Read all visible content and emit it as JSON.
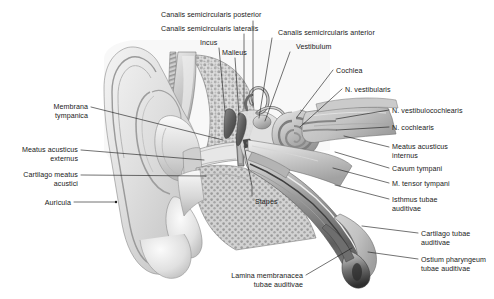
{
  "figure": {
    "background_color": "#ffffff",
    "text_color": "#1a1a1a",
    "leader_color": "#1a1a1a",
    "width": 494,
    "height": 299
  },
  "labels": [
    {
      "id": "canalis-semicircularis-posterior",
      "text": "Canalis semicircularis posterior",
      "lines": [
        "Canalis semicircularis posterior"
      ],
      "align": "left",
      "x": 161,
      "y": 11
    },
    {
      "id": "canalis-semicircularis-lateralis",
      "text": "Canalis semicircularis lateralis",
      "lines": [
        "Canalis semicircularis lateralis"
      ],
      "align": "left",
      "x": 161,
      "y": 25
    },
    {
      "id": "incus",
      "text": "Incus",
      "lines": [
        "Incus"
      ],
      "align": "left",
      "x": 200,
      "y": 39
    },
    {
      "id": "malleus",
      "text": "Malleus",
      "lines": [
        "Malleus"
      ],
      "align": "left",
      "x": 222,
      "y": 49
    },
    {
      "id": "canalis-semicircularis-anterior",
      "text": "Canalis semicircularis anterior",
      "lines": [
        "Canalis semicircularis anterior"
      ],
      "align": "left",
      "x": 278,
      "y": 29
    },
    {
      "id": "vestibulum",
      "text": "Vestibulum",
      "lines": [
        "Vestibulum"
      ],
      "align": "left",
      "x": 296,
      "y": 43
    },
    {
      "id": "cochlea",
      "text": "Cochlea",
      "lines": [
        "Cochlea"
      ],
      "align": "left",
      "x": 336,
      "y": 67
    },
    {
      "id": "n-vestibularis",
      "text": "N. vestibularis",
      "lines": [
        "N. vestibularis"
      ],
      "align": "left",
      "x": 345,
      "y": 86
    },
    {
      "id": "n-vestibulocochlearis",
      "text": "N. vestibulocochlearis",
      "lines": [
        "N. vestibulocochlearis"
      ],
      "align": "left",
      "x": 392,
      "y": 107
    },
    {
      "id": "n-cochlearis",
      "text": "N. cochlearis",
      "lines": [
        "N. cochlearis"
      ],
      "align": "left",
      "x": 392,
      "y": 124
    },
    {
      "id": "meatus-acusticus-internus",
      "text": "Meatus acusticus internus",
      "lines": [
        "Meatus acusticus",
        "internus"
      ],
      "align": "left",
      "x": 392,
      "y": 143
    },
    {
      "id": "cavum-tympani",
      "text": "Cavum tympani",
      "lines": [
        "Cavum tympani"
      ],
      "align": "left",
      "x": 392,
      "y": 165
    },
    {
      "id": "m-tensor-tympani",
      "text": "M. tensor tympani",
      "lines": [
        "M. tensor tympani"
      ],
      "align": "left",
      "x": 392,
      "y": 180
    },
    {
      "id": "isthmus-tubae-auditivae",
      "text": "Isthmus tubae auditivae",
      "lines": [
        "Isthmus tubae",
        "auditivae"
      ],
      "align": "left",
      "x": 392,
      "y": 196
    },
    {
      "id": "cartilago-tubae-auditivae",
      "text": "Cartilago tubae auditivae",
      "lines": [
        "Cartilago tubae",
        "auditivae"
      ],
      "align": "left",
      "x": 421,
      "y": 230
    },
    {
      "id": "ostium-pharyngeum-tubae-auditivae",
      "text": "Ostium pharyngeum tubae auditivae",
      "lines": [
        "Ostium pharyngeum",
        "tubae auditivae"
      ],
      "align": "left",
      "x": 421,
      "y": 256
    },
    {
      "id": "membrana-tympanica",
      "text": "Membrana tympanica",
      "lines": [
        "Membrana",
        "tympanica"
      ],
      "align": "right",
      "x": 88,
      "y": 103
    },
    {
      "id": "meatus-acusticus-externus",
      "text": "Meatus acusticus externus",
      "lines": [
        "Meatus acusticus",
        "externus"
      ],
      "align": "right",
      "x": 78,
      "y": 146
    },
    {
      "id": "cartilago-meatus-acustici",
      "text": "Cartilago meatus acustici",
      "lines": [
        "Cartilago meatus",
        "acustici"
      ],
      "align": "right",
      "x": 78,
      "y": 171
    },
    {
      "id": "auricula",
      "text": "Auricula",
      "lines": [
        "Auricula"
      ],
      "align": "right",
      "x": 71,
      "y": 199
    },
    {
      "id": "stapes",
      "text": "Stapes",
      "lines": [
        "Stapes"
      ],
      "align": "left",
      "x": 255,
      "y": 198
    },
    {
      "id": "lamina-membranacea-tubae-auditivae",
      "text": "Lamina membranacea tubae auditivae",
      "lines": [
        "Lamina membranacea",
        "tubae auditivae"
      ],
      "align": "right",
      "x": 303,
      "y": 272
    }
  ],
  "leaders": [
    {
      "id": "leader-canalis-posterior",
      "points": "253,21 253,106"
    },
    {
      "id": "leader-canalis-lateralis",
      "points": "244,34 244,109"
    },
    {
      "id": "leader-incus",
      "points": "219,48 225,112"
    },
    {
      "id": "leader-malleus",
      "points": "235,58 239,115"
    },
    {
      "id": "leader-canalis-anterior",
      "points": "272,38 259,118"
    },
    {
      "id": "leader-vestibulum",
      "points": "290,52 265,121"
    },
    {
      "id": "leader-cochlea",
      "points": "333,70 297,117"
    },
    {
      "id": "leader-n-vestibularis",
      "points": "342,89 300,127"
    },
    {
      "id": "leader-n-vestibulocochlearis",
      "points": "389,110 336,119"
    },
    {
      "id": "leader-n-cochlearis",
      "points": "389,127 337,130"
    },
    {
      "id": "leader-meatus-acusticus-internus",
      "points": "389,147 344,136"
    },
    {
      "id": "leader-cavum-tympani",
      "points": "389,168 335,152"
    },
    {
      "id": "leader-m-tensor-tympani",
      "points": "389,183 333,168"
    },
    {
      "id": "leader-isthmus",
      "points": "389,199 335,185"
    },
    {
      "id": "leader-cartilago-tubae",
      "points": "418,233 362,226"
    },
    {
      "id": "leader-ostium",
      "points": "418,259 368,252"
    },
    {
      "id": "leader-membrana-tympanica",
      "points": "91,107 223,140"
    },
    {
      "id": "leader-meatus-externus",
      "points": "81,150 204,160"
    },
    {
      "id": "leader-cartilago-meatus",
      "points": "81,175 206,176"
    },
    {
      "id": "leader-auricula",
      "points": "74,202 116,202"
    },
    {
      "id": "leader-stapes",
      "points": "252,196 252,186 244,146"
    },
    {
      "id": "leader-lamina",
      "points": "306,275 352,248"
    }
  ],
  "anatomy_parts": [
    {
      "id": "auricula-pinna",
      "name": "auricula"
    },
    {
      "id": "external-auditory-canal",
      "name": "meatus-acusticus-externus"
    },
    {
      "id": "tympanic-membrane",
      "name": "membrana-tympanica"
    },
    {
      "id": "mastoid-bone",
      "name": "mastoid-air-cells"
    },
    {
      "id": "cochlea-spiral",
      "name": "cochlea"
    },
    {
      "id": "semicircular-canals",
      "name": "canales-semicirculares"
    },
    {
      "id": "eustachian-tube",
      "name": "tuba-auditiva"
    },
    {
      "id": "ossicles",
      "name": "ossicula-auditus"
    }
  ]
}
